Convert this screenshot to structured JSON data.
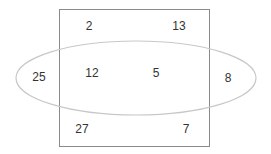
{
  "diagram": {
    "type": "venn",
    "shapes": [
      {
        "name": "rectangle",
        "stroke": "#8a8a8a"
      },
      {
        "name": "ellipse",
        "stroke": "#c8c8c8"
      }
    ],
    "regions": {
      "rect_only_top_left": "2",
      "rect_only_top_right": "13",
      "ellipse_only_left": "25",
      "intersection_left": "12",
      "intersection_right": "5",
      "ellipse_only_right": "8",
      "rect_only_bottom_left": "27",
      "rect_only_bottom_right": "7"
    }
  }
}
